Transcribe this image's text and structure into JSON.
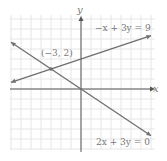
{
  "chart_data": {
    "type": "line",
    "title": "",
    "xlabel": "x",
    "ylabel": "y",
    "xlim": [
      -7,
      7
    ],
    "ylim": [
      -6,
      7
    ],
    "grid": true,
    "tick_labels": false,
    "series": [
      {
        "name": "-x + 3y = 9",
        "equation": "-x + 3y = 9",
        "slope": 0.3333,
        "intercept": 3,
        "x": [
          -7,
          7
        ],
        "y": [
          0.667,
          5.333
        ]
      },
      {
        "name": "2x + 3y = 0",
        "equation": "2x + 3y = 0",
        "slope": -0.6667,
        "intercept": 0,
        "x": [
          -7,
          7
        ],
        "y": [
          4.667,
          -4.667
        ]
      }
    ],
    "annotations": [
      {
        "text": "(−3, 2)",
        "x": -3,
        "y": 2,
        "type": "intersection-point"
      }
    ]
  },
  "labels": {
    "x_axis": "x",
    "y_axis": "y",
    "line1": "−x + 3y = 9",
    "line2": "2x + 3y = 0",
    "point": "(−3, 2)"
  },
  "colors": {
    "grid": "#e6e6e6",
    "axis": "#555555",
    "line": "#6e6e6e",
    "text": "#777777"
  }
}
